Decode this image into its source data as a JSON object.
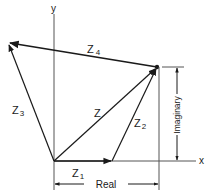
{
  "diagram": {
    "title": "",
    "axes": {
      "x_label": "x",
      "y_label": "y"
    },
    "vectors": [
      {
        "name": "Z1",
        "label_main": "Z",
        "label_sub": "1",
        "from": "origin",
        "to": "end of Z1 on real axis"
      },
      {
        "name": "Z2",
        "label_main": "Z",
        "label_sub": "2",
        "from": "tip of Z1",
        "to": "P"
      },
      {
        "name": "Z",
        "label_main": "Z",
        "label_sub": "",
        "from": "origin",
        "to": "P"
      },
      {
        "name": "Z3",
        "label_main": "Z",
        "label_sub": "3",
        "from": "origin",
        "to": "upper-left point"
      },
      {
        "name": "Z4",
        "label_main": "Z",
        "label_sub": "4",
        "from": "P",
        "to": "upper-left point"
      }
    ],
    "dimensions": {
      "real_label": "Real",
      "imaginary_label": "Imaginary"
    },
    "colors": {
      "line": "#1a1a1a",
      "axis": "#555555",
      "background": "#ffffff"
    }
  }
}
